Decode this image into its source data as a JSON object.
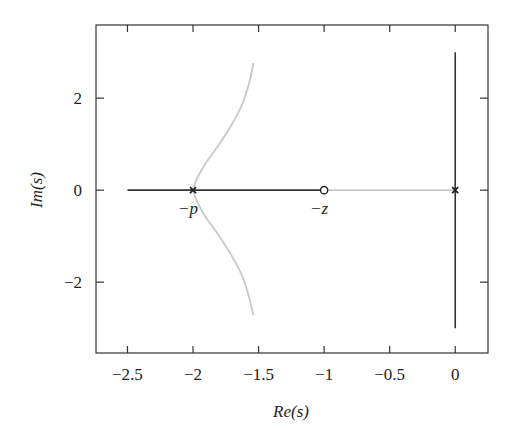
{
  "chart_data": {
    "type": "line",
    "title": "",
    "xlabel": "Re(s)",
    "ylabel": "Im(s)",
    "xlim": [
      -2.74,
      0.25
    ],
    "ylim": [
      -3.54,
      3.59
    ],
    "xticks": [
      -2.5,
      -2,
      -1.5,
      -1,
      -0.5,
      0
    ],
    "xtick_labels": [
      "−2.5",
      "−2",
      "−1.5",
      "−1",
      "−0.5",
      "0"
    ],
    "yticks": [
      -2,
      0,
      2
    ],
    "ytick_labels": [
      "−2",
      "0",
      "2"
    ],
    "grid": false,
    "legend": null,
    "series": [
      {
        "name": "real-axis-segment-left",
        "color": "#333333",
        "x": [
          -2.5,
          -1.0
        ],
        "y": [
          0,
          0
        ]
      },
      {
        "name": "real-axis-segment-right",
        "color": "#c8c8c8",
        "x": [
          -1.0,
          0.0
        ],
        "y": [
          0,
          0
        ]
      },
      {
        "name": "imaginary-axis-locus",
        "color": "#333333",
        "x": [
          0,
          0
        ],
        "y": [
          -3.0,
          3.0
        ]
      },
      {
        "name": "upper-branch",
        "color": "#c8c8c8",
        "x": [
          -2.0,
          -1.97,
          -1.9,
          -1.8,
          -1.7,
          -1.62,
          -1.57,
          -1.54
        ],
        "y": [
          0,
          0.25,
          0.6,
          1.0,
          1.45,
          1.9,
          2.35,
          2.76
        ]
      },
      {
        "name": "lower-branch",
        "color": "#c8c8c8",
        "x": [
          -2.0,
          -1.97,
          -1.9,
          -1.8,
          -1.7,
          -1.62,
          -1.57,
          -1.54
        ],
        "y": [
          0,
          -0.25,
          -0.6,
          -1.0,
          -1.45,
          -1.9,
          -2.35,
          -2.72
        ]
      }
    ],
    "markers": [
      {
        "type": "pole",
        "symbol": "x",
        "x": -2.0,
        "y": 0,
        "label": "−p"
      },
      {
        "type": "zero",
        "symbol": "o",
        "x": -1.0,
        "y": 0,
        "label": "−z"
      },
      {
        "type": "pole",
        "symbol": "x",
        "x": 0.0,
        "y": 0,
        "label": ""
      }
    ]
  }
}
